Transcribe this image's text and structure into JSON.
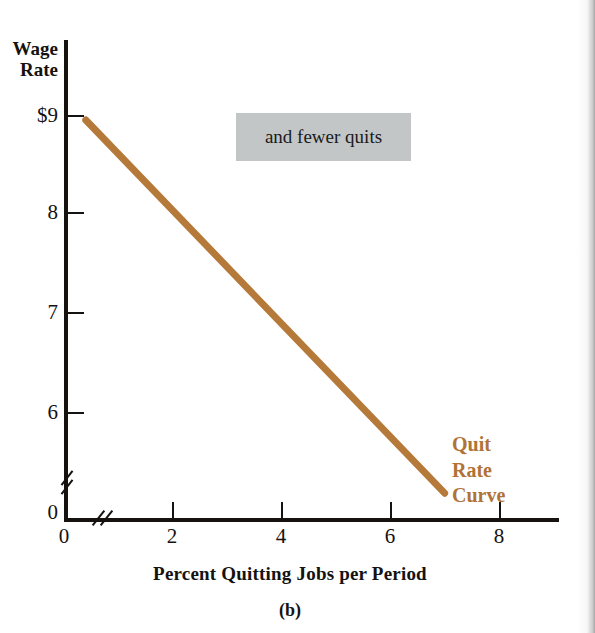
{
  "figure": {
    "caption": "(b)",
    "annotation": "and fewer quits"
  },
  "chart_data": {
    "type": "line",
    "title": "",
    "subtitle": "",
    "xlabel": "Percent Quitting Jobs per Period",
    "ylabel": "Wage Rate",
    "xlim": [
      0,
      9
    ],
    "ylim": [
      0,
      9.4
    ],
    "grid": false,
    "legend_position": "inline-right",
    "axis_breaks": {
      "x": true,
      "y": true
    },
    "x_ticks": [
      {
        "value": 0,
        "label": "0"
      },
      {
        "value": 2,
        "label": "2"
      },
      {
        "value": 4,
        "label": "4"
      },
      {
        "value": 6,
        "label": "6"
      },
      {
        "value": 8,
        "label": "8"
      }
    ],
    "y_ticks": [
      {
        "value": 9,
        "label": "$9"
      },
      {
        "value": 8,
        "label": "8"
      },
      {
        "value": 7,
        "label": "7"
      },
      {
        "value": 6,
        "label": "6"
      },
      {
        "value": 0,
        "label": "0"
      }
    ],
    "series": [
      {
        "name": "Quit Rate Curve",
        "color": "#b5793a",
        "linewidth": 7,
        "x": [
          0.4,
          7.0
        ],
        "y": [
          8.95,
          5.18
        ],
        "label_lines": [
          "Quit",
          "Rate",
          "Curve"
        ],
        "label_color": "#b07337"
      }
    ],
    "annotations": [
      {
        "text": "and fewer quits",
        "x": 3.2,
        "y": 8.7,
        "style": "gray-box",
        "background": "#c2c6c7"
      }
    ]
  },
  "colors": {
    "axis": "#15120f",
    "curve": "#b5793a",
    "curve_label": "#b07337",
    "annotation_box": "#c2c6c7",
    "background": "#ffffff"
  }
}
